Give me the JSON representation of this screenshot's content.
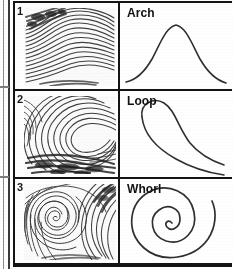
{
  "figure": {
    "kind": "fingerprint-pattern-classification-table",
    "columns": [
      "fingerprint-sample",
      "pattern-diagram"
    ],
    "rows": [
      {
        "number": "1",
        "pattern_label": "Arch",
        "print_icon": "fingerprint-arch-icon",
        "diagram_icon": "arch-curve-icon",
        "ridge_flow": "arch"
      },
      {
        "number": "2",
        "pattern_label": "Loop",
        "print_icon": "fingerprint-loop-icon",
        "diagram_icon": "loop-curve-icon",
        "ridge_flow": "loop"
      },
      {
        "number": "3",
        "pattern_label": "Whorl",
        "print_icon": "fingerprint-whorl-icon",
        "diagram_icon": "whorl-spiral-icon",
        "ridge_flow": "whorl"
      }
    ]
  },
  "colors": {
    "ink": "#141414",
    "line": "#3a3a3a",
    "paper": "#ffffff",
    "ridge": "#2b2b2b"
  }
}
